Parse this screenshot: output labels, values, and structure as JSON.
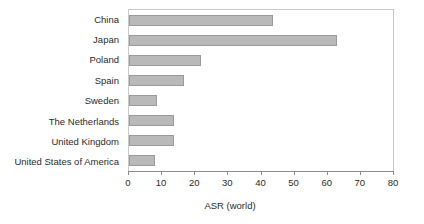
{
  "chart_data": {
    "type": "bar",
    "orientation": "horizontal",
    "title": "",
    "xlabel": "ASR (world)",
    "ylabel": "",
    "categories": [
      "China",
      "Japan",
      "Poland",
      "Spain",
      "Sweden",
      "The Netherlands",
      "United Kingdom",
      "United States of America"
    ],
    "values": [
      43.6,
      63.0,
      21.8,
      16.6,
      8.5,
      13.6,
      13.6,
      8.0
    ],
    "xlim": [
      0,
      80
    ],
    "ylim": null,
    "xticks": [
      0,
      10,
      20,
      30,
      40,
      50,
      60,
      70,
      80
    ],
    "xtick_labels": [
      "0",
      "10",
      "20",
      "30",
      "40",
      "50",
      "60",
      "70",
      "80"
    ],
    "grid": false,
    "legend": null,
    "series": [
      {
        "name": "ASR (world)",
        "values": [
          43.6,
          63.0,
          21.8,
          16.6,
          8.5,
          13.6,
          13.6,
          8.0
        ]
      }
    ],
    "colors": {
      "bar_fill": "#b9b9b9",
      "bar_border": "#9a9a9a",
      "axis": "#8d8d8d",
      "frame": "#c9c9c9",
      "text": "#2b2b2b",
      "background": "#ffffff"
    }
  }
}
